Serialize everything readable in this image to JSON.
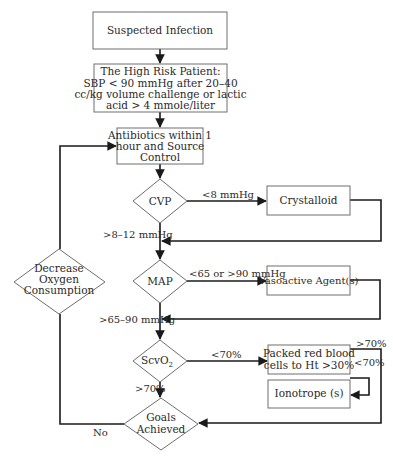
{
  "diagram": {
    "type": "flowchart",
    "nodes": {
      "suspected_infection": {
        "shape": "rect",
        "lines": [
          "Suspected Infection"
        ]
      },
      "high_risk": {
        "shape": "rect",
        "lines": [
          "The High Risk Patient:",
          "SBP < 90 mmHg after 20–40",
          "cc/kg volume challenge or lactic",
          "acid > 4 mmole/liter"
        ]
      },
      "antibiotics": {
        "shape": "rect",
        "lines": [
          "Antibiotics within 1",
          "hour and Source",
          "Control"
        ]
      },
      "cvp": {
        "shape": "diamond",
        "lines": [
          "CVP"
        ]
      },
      "crystalloid": {
        "shape": "rect",
        "lines": [
          "Crystalloid"
        ]
      },
      "map": {
        "shape": "diamond",
        "lines": [
          "MAP"
        ]
      },
      "vasoactive": {
        "shape": "rect",
        "lines": [
          "Vasoactive Agent(s)"
        ]
      },
      "scvo2": {
        "shape": "diamond",
        "lines": [
          "ScvO",
          "2"
        ]
      },
      "prbc": {
        "shape": "rect",
        "lines": [
          "Packed red blood",
          "cells to Ht >30%"
        ]
      },
      "ionotrope": {
        "shape": "rect",
        "lines": [
          "Ionotrope (s)"
        ]
      },
      "goals": {
        "shape": "diamond",
        "lines": [
          "Goals",
          "Achieved"
        ]
      },
      "decrease_o2": {
        "shape": "diamond",
        "lines": [
          "Decrease",
          "Oxygen",
          "Consumption"
        ]
      }
    },
    "edge_labels": {
      "cvp_low": "<8 mmHg",
      "cvp_ok": ">8–12 mmHg",
      "map_bad": "<65 or >90 mmHg",
      "map_ok": ">65–90 mmHg",
      "scvo2_low": "<70%",
      "scvo2_ok": ">70%",
      "prbc_ok": ">70%",
      "prbc_low": "<70%",
      "goals_no": "No"
    },
    "edges": [
      {
        "from": "suspected_infection",
        "to": "high_risk"
      },
      {
        "from": "high_risk",
        "to": "antibiotics"
      },
      {
        "from": "antibiotics",
        "to": "cvp"
      },
      {
        "from": "cvp",
        "to": "crystalloid",
        "label": "<8 mmHg"
      },
      {
        "from": "crystalloid",
        "to": "map"
      },
      {
        "from": "cvp",
        "to": "map",
        "label": ">8–12 mmHg"
      },
      {
        "from": "map",
        "to": "vasoactive",
        "label": "<65 or >90 mmHg"
      },
      {
        "from": "vasoactive",
        "to": "scvo2"
      },
      {
        "from": "map",
        "to": "scvo2",
        "label": ">65–90 mmHg"
      },
      {
        "from": "scvo2",
        "to": "prbc",
        "label": "<70%"
      },
      {
        "from": "scvo2",
        "to": "goals",
        "label": ">70%"
      },
      {
        "from": "prbc",
        "to": "goals",
        "label": ">70%"
      },
      {
        "from": "prbc",
        "to": "ionotrope",
        "label": "<70%"
      },
      {
        "from": "goals",
        "to": "decrease_o2",
        "label": "No"
      },
      {
        "from": "decrease_o2",
        "to": "antibiotics"
      }
    ]
  }
}
